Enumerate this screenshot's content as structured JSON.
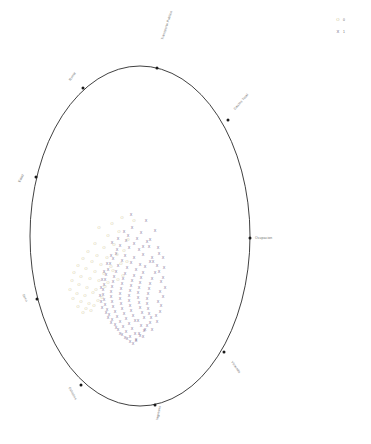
{
  "figure": {
    "title": "",
    "background_color": "#ffffff",
    "outline_color": "#2b2b2b"
  },
  "legend": {
    "position": "top-right",
    "items": [
      {
        "key_glyph": "O",
        "key_color": "#c9c08a",
        "label": "0"
      },
      {
        "key_glyph": "X",
        "key_color": "#6e5f86",
        "label": "1"
      }
    ]
  },
  "chart_data": {
    "type": "scatter",
    "title": "",
    "xlabel": "",
    "ylabel": "",
    "grid": false,
    "legend_position": "top-right",
    "xlim": [
      -1,
      1
    ],
    "ylim": [
      -1,
      1
    ],
    "boundary": {
      "shape": "ellipse",
      "cx": 140,
      "cy": 236,
      "rx": 110,
      "ry": 170,
      "stroke": "#2b2b2b"
    },
    "axis_markers": [
      {
        "label": "Transporte Publico",
        "angle_deg": 78,
        "dot_x": 157,
        "dot_y": 68,
        "label_x": 163,
        "label_y": 40,
        "rotate": -72
      },
      {
        "label": "Renta",
        "angle_deg": 118,
        "dot_x": 83,
        "dot_y": 88,
        "label_x": 76,
        "label_y": 73,
        "rotate": -55
      },
      {
        "label": "Gastos Total",
        "angle_deg": 37,
        "dot_x": 228,
        "dot_y": 120,
        "label_x": 235,
        "label_y": 110,
        "rotate": -48
      },
      {
        "label": "Edad",
        "angle_deg": 160,
        "dot_x": 36,
        "dot_y": 177,
        "label_x": 24,
        "label_y": 175,
        "rotate": -62
      },
      {
        "label": "Ocupacion",
        "angle_deg": 0,
        "dot_x": 250,
        "dot_y": 238,
        "label_x": 255,
        "label_y": 239,
        "rotate": 0
      },
      {
        "label": "Sexo",
        "angle_deg": 200,
        "dot_x": 37,
        "dot_y": 299,
        "label_x": 26,
        "label_y": 302,
        "rotate": 62
      },
      {
        "label": "Vivienda",
        "angle_deg": 325,
        "dot_x": 224,
        "dot_y": 352,
        "label_x": 231,
        "label_y": 362,
        "rotate": 55
      },
      {
        "label": "Estudios",
        "angle_deg": 237,
        "dot_x": 81,
        "dot_y": 385,
        "label_x": 75,
        "label_y": 400,
        "rotate": 62
      },
      {
        "label": "Ingresos",
        "angle_deg": 270,
        "dot_x": 155,
        "dot_y": 405,
        "label_x": 158,
        "label_y": 420,
        "rotate": -78
      }
    ],
    "series": [
      {
        "name": "0",
        "marker": "O",
        "color": "#cfc58f",
        "count": 52,
        "points": [
          [
            99,
            228
          ],
          [
            112,
            224
          ],
          [
            122,
            218
          ],
          [
            134,
            221
          ],
          [
            108,
            236
          ],
          [
            119,
            232
          ],
          [
            128,
            240
          ],
          [
            95,
            244
          ],
          [
            104,
            248
          ],
          [
            114,
            245
          ],
          [
            124,
            251
          ],
          [
            88,
            252
          ],
          [
            97,
            256
          ],
          [
            107,
            258
          ],
          [
            117,
            255
          ],
          [
            127,
            262
          ],
          [
            83,
            259
          ],
          [
            92,
            262
          ],
          [
            101,
            265
          ],
          [
            111,
            267
          ],
          [
            121,
            264
          ],
          [
            78,
            266
          ],
          [
            86,
            269
          ],
          [
            95,
            272
          ],
          [
            104,
            274
          ],
          [
            113,
            271
          ],
          [
            123,
            276
          ],
          [
            74,
            273
          ],
          [
            81,
            277
          ],
          [
            90,
            279
          ],
          [
            99,
            281
          ],
          [
            108,
            283
          ],
          [
            118,
            280
          ],
          [
            72,
            281
          ],
          [
            79,
            285
          ],
          [
            87,
            288
          ],
          [
            96,
            290
          ],
          [
            105,
            287
          ],
          [
            70,
            290
          ],
          [
            77,
            294
          ],
          [
            85,
            296
          ],
          [
            93,
            293
          ],
          [
            102,
            298
          ],
          [
            73,
            299
          ],
          [
            81,
            302
          ],
          [
            89,
            304
          ],
          [
            98,
            301
          ],
          [
            78,
            307
          ],
          [
            86,
            309
          ],
          [
            94,
            306
          ],
          [
            83,
            313
          ],
          [
            91,
            311
          ]
        ]
      },
      {
        "name": "1",
        "marker": "X",
        "color": "#7a6a91",
        "count": 150,
        "points": [
          [
            131,
            215
          ],
          [
            146,
            221
          ],
          [
            155,
            231
          ],
          [
            128,
            236
          ],
          [
            137,
            239
          ],
          [
            147,
            242
          ],
          [
            120,
            246
          ],
          [
            129,
            248
          ],
          [
            139,
            250
          ],
          [
            149,
            247
          ],
          [
            159,
            254
          ],
          [
            116,
            254
          ],
          [
            125,
            256
          ],
          [
            134,
            258
          ],
          [
            143,
            255
          ],
          [
            153,
            262
          ],
          [
            113,
            259
          ],
          [
            122,
            261
          ],
          [
            131,
            263
          ],
          [
            140,
            265
          ],
          [
            150,
            262
          ],
          [
            110,
            264
          ],
          [
            118,
            266
          ],
          [
            127,
            268
          ],
          [
            136,
            270
          ],
          [
            145,
            267
          ],
          [
            155,
            273
          ],
          [
            108,
            270
          ],
          [
            116,
            272
          ],
          [
            125,
            274
          ],
          [
            134,
            276
          ],
          [
            143,
            273
          ],
          [
            152,
            279
          ],
          [
            106,
            275
          ],
          [
            114,
            277
          ],
          [
            123,
            279
          ],
          [
            132,
            281
          ],
          [
            141,
            278
          ],
          [
            150,
            284
          ],
          [
            105,
            280
          ],
          [
            113,
            282
          ],
          [
            122,
            284
          ],
          [
            131,
            286
          ],
          [
            140,
            283
          ],
          [
            149,
            289
          ],
          [
            104,
            285
          ],
          [
            112,
            287
          ],
          [
            121,
            289
          ],
          [
            130,
            291
          ],
          [
            139,
            288
          ],
          [
            148,
            294
          ],
          [
            103,
            290
          ],
          [
            111,
            292
          ],
          [
            120,
            294
          ],
          [
            129,
            296
          ],
          [
            138,
            293
          ],
          [
            147,
            299
          ],
          [
            103,
            295
          ],
          [
            111,
            297
          ],
          [
            120,
            299
          ],
          [
            129,
            301
          ],
          [
            138,
            298
          ],
          [
            147,
            304
          ],
          [
            104,
            300
          ],
          [
            112,
            302
          ],
          [
            121,
            304
          ],
          [
            130,
            306
          ],
          [
            139,
            303
          ],
          [
            148,
            309
          ],
          [
            105,
            305
          ],
          [
            113,
            307
          ],
          [
            122,
            309
          ],
          [
            131,
            311
          ],
          [
            140,
            308
          ],
          [
            149,
            314
          ],
          [
            107,
            310
          ],
          [
            115,
            312
          ],
          [
            124,
            314
          ],
          [
            133,
            316
          ],
          [
            142,
            313
          ],
          [
            151,
            318
          ],
          [
            109,
            315
          ],
          [
            117,
            317
          ],
          [
            126,
            319
          ],
          [
            135,
            321
          ],
          [
            144,
            318
          ],
          [
            112,
            320
          ],
          [
            120,
            322
          ],
          [
            129,
            324
          ],
          [
            138,
            321
          ],
          [
            147,
            326
          ],
          [
            115,
            325
          ],
          [
            123,
            327
          ],
          [
            132,
            329
          ],
          [
            141,
            326
          ],
          [
            118,
            330
          ],
          [
            126,
            332
          ],
          [
            135,
            334
          ],
          [
            144,
            331
          ],
          [
            122,
            335
          ],
          [
            130,
            337
          ],
          [
            139,
            334
          ],
          [
            127,
            339
          ],
          [
            136,
            341
          ],
          [
            133,
            344
          ],
          [
            143,
            337
          ],
          [
            152,
            330
          ],
          [
            157,
            322
          ],
          [
            160,
            312
          ],
          [
            158,
            302
          ],
          [
            160,
            292
          ],
          [
            161,
            282
          ],
          [
            159,
            272
          ],
          [
            157,
            266
          ],
          [
            152,
            258
          ],
          [
            143,
            247
          ],
          [
            134,
            244
          ],
          [
            126,
            241
          ],
          [
            118,
            239
          ],
          [
            112,
            243
          ],
          [
            124,
            232
          ],
          [
            132,
            228
          ],
          [
            141,
            233
          ],
          [
            150,
            240
          ],
          [
            158,
            248
          ],
          [
            163,
            258
          ],
          [
            164,
            268
          ],
          [
            163,
            278
          ],
          [
            165,
            288
          ],
          [
            163,
            297
          ],
          [
            161,
            306
          ],
          [
            156,
            316
          ],
          [
            150,
            323
          ],
          [
            145,
            330
          ],
          [
            140,
            336
          ],
          [
            136,
            340
          ],
          [
            130,
            342
          ],
          [
            125,
            338
          ],
          [
            120,
            334
          ],
          [
            116,
            328
          ],
          [
            111,
            323
          ],
          [
            108,
            318
          ],
          [
            106,
            313
          ],
          [
            102,
            308
          ],
          [
            101,
            302
          ],
          [
            100,
            296
          ],
          [
            101,
            288
          ],
          [
            102,
            280
          ],
          [
            104,
            272
          ],
          [
            107,
            264
          ],
          [
            111,
            256
          ],
          [
            117,
            250
          ]
        ]
      }
    ]
  }
}
